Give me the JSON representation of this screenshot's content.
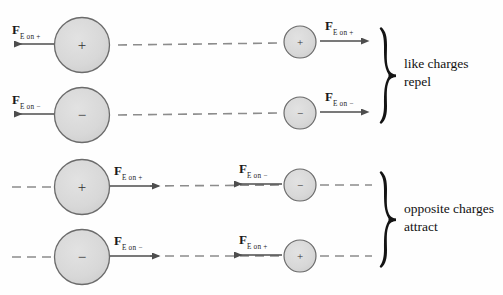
{
  "figure": {
    "background_color": "#fefefe",
    "charge_fill": "#d9d9d9",
    "charge_stroke": "#6b6b6b",
    "dash_color": "#8c8c8c",
    "arrow_color": "#4d4d4d",
    "text_color": "#111111"
  },
  "force_symbol": "F",
  "rows": [
    {
      "id": "row-1",
      "group": "like-charges",
      "left": {
        "sign": "+",
        "size": "large",
        "cx": 82,
        "cy": 45,
        "r": 27.5,
        "force_label_main": "F",
        "force_label_sub": "E on +",
        "arrow_direction": "left"
      },
      "right": {
        "sign": "+",
        "size": "small",
        "cx": 300,
        "cy": 42,
        "r": 16,
        "force_label_main": "F",
        "force_label_sub": "E on +",
        "arrow_direction": "right"
      }
    },
    {
      "id": "row-2",
      "group": "like-charges",
      "left": {
        "sign": "−",
        "size": "large",
        "cx": 82,
        "cy": 115,
        "r": 27.5,
        "force_label_main": "F",
        "force_label_sub": "E on −",
        "arrow_direction": "left"
      },
      "right": {
        "sign": "−",
        "size": "small",
        "cx": 300,
        "cy": 113,
        "r": 16,
        "force_label_main": "F",
        "force_label_sub": "E on −",
        "arrow_direction": "right"
      }
    },
    {
      "id": "row-3",
      "group": "opposite-charges",
      "left": {
        "sign": "+",
        "size": "large",
        "cx": 82,
        "cy": 187,
        "r": 27.5,
        "force_label_main": "F",
        "force_label_sub": "E on +",
        "arrow_direction": "right"
      },
      "right": {
        "sign": "−",
        "size": "small",
        "cx": 300,
        "cy": 185,
        "r": 16,
        "force_label_main": "F",
        "force_label_sub": "E on −",
        "arrow_direction": "left"
      }
    },
    {
      "id": "row-4",
      "group": "opposite-charges",
      "left": {
        "sign": "−",
        "size": "large",
        "cx": 82,
        "cy": 257,
        "r": 27.5,
        "force_label_main": "F",
        "force_label_sub": "E on −",
        "arrow_direction": "right"
      },
      "right": {
        "sign": "+",
        "size": "small",
        "cx": 300,
        "cy": 256,
        "r": 16,
        "force_label_main": "F",
        "force_label_sub": "E on +",
        "arrow_direction": "left"
      }
    }
  ],
  "braces": [
    {
      "id": "brace-like",
      "line1": "like charges",
      "line2": "repel"
    },
    {
      "id": "brace-opposite",
      "line1": "opposite charges",
      "line2": "attract"
    }
  ]
}
